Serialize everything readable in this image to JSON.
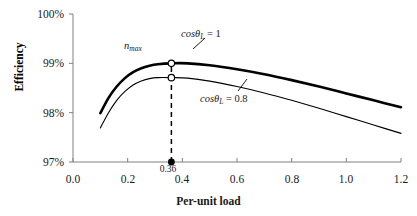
{
  "chart_data": {
    "type": "line",
    "title": "",
    "xlabel": "Per-unit load",
    "ylabel": "Efficiency",
    "xlim": [
      0.0,
      1.2
    ],
    "ylim": [
      97,
      100
    ],
    "grid": false,
    "legend_position": "inline-annotation",
    "x_ticks": [
      "0.0",
      "0.2",
      "0.4",
      "0.6",
      "0.8",
      "1.0",
      "1.2"
    ],
    "x_tick_values": [
      0.0,
      0.2,
      0.4,
      0.6,
      0.8,
      1.0,
      1.2
    ],
    "y_ticks": [
      "97%",
      "98%",
      "99%",
      "100%"
    ],
    "y_tick_values": [
      97,
      98,
      99,
      100
    ],
    "series": [
      {
        "name": "cosθ_L = 1",
        "label_text": "cosθ",
        "label_sub": "L",
        "label_eq": " = 1",
        "style": "thick",
        "x": [
          0.1,
          0.13,
          0.16,
          0.19,
          0.22,
          0.25,
          0.28,
          0.31,
          0.36,
          0.42,
          0.5,
          0.6,
          0.7,
          0.8,
          0.9,
          1.0,
          1.1,
          1.2
        ],
        "y": [
          97.99,
          98.3,
          98.53,
          98.7,
          98.82,
          98.9,
          98.95,
          98.98,
          99.0,
          99.0,
          98.96,
          98.88,
          98.78,
          98.66,
          98.53,
          98.39,
          98.25,
          98.11
        ]
      },
      {
        "name": "cosθ_L = 0.8",
        "label_text": "cosθ",
        "label_sub": "L",
        "label_eq": " = 0.8",
        "style": "thin",
        "x": [
          0.1,
          0.13,
          0.16,
          0.19,
          0.22,
          0.25,
          0.28,
          0.31,
          0.36,
          0.42,
          0.5,
          0.6,
          0.7,
          0.8,
          0.9,
          1.0,
          1.1,
          1.2
        ],
        "y": [
          97.69,
          98.0,
          98.25,
          98.43,
          98.56,
          98.64,
          98.69,
          98.71,
          98.71,
          98.7,
          98.64,
          98.53,
          98.4,
          98.25,
          98.09,
          97.92,
          97.75,
          97.58
        ]
      }
    ],
    "annotations": [
      {
        "name": "eta-max",
        "text": "n",
        "sub": "max",
        "x": 0.36,
        "y": 99.0
      },
      {
        "name": "optimal-load-value",
        "text": "0.36",
        "x": 0.36,
        "y": 97.0
      }
    ],
    "markers": [
      {
        "name": "peak-marker-cos1",
        "x": 0.36,
        "y": 99.0,
        "fill": "open"
      },
      {
        "name": "peak-marker-cos08",
        "x": 0.36,
        "y": 98.71,
        "fill": "open"
      },
      {
        "name": "axis-marker-036",
        "x": 0.36,
        "y": 97.0,
        "fill": "solid"
      }
    ],
    "vline": {
      "name": "optimal-load-dashed-line",
      "x": 0.36,
      "y_from": 97.0,
      "y_to": 99.05,
      "dashed": true
    },
    "colors": {
      "line": "#000000",
      "axis": "#808080",
      "text": "#1a1a1a"
    }
  }
}
